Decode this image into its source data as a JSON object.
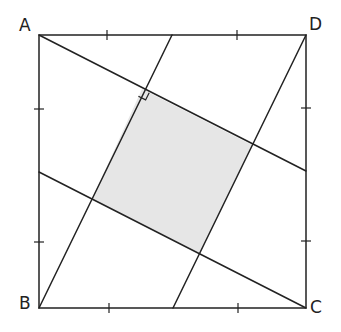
{
  "diagram": {
    "type": "geometry",
    "vertices": {
      "A": {
        "label": "A",
        "x": 39,
        "y": 35
      },
      "B": {
        "label": "B",
        "x": 39,
        "y": 308
      },
      "C": {
        "label": "C",
        "x": 306,
        "y": 308
      },
      "D": {
        "label": "D",
        "x": 306,
        "y": 35
      }
    },
    "midpoints": {
      "AD_mid": {
        "x": 172,
        "y": 35
      },
      "BC_mid": {
        "x": 173,
        "y": 308
      },
      "AB_mid": {
        "x": 39,
        "y": 172
      },
      "DC_mid": {
        "x": 306,
        "y": 171
      }
    },
    "segments": [
      {
        "name": "A-to-DC-mid",
        "from": "A",
        "to": "DC_mid"
      },
      {
        "name": "B-to-AD-mid",
        "from": "B",
        "to": "AD_mid"
      },
      {
        "name": "C-to-AB-mid",
        "from": "C",
        "to": "AB_mid"
      },
      {
        "name": "D-to-BC-mid",
        "from": "D",
        "to": "BC_mid"
      }
    ],
    "inner_square": {
      "points": [
        [
          142,
          89
        ],
        [
          252,
          145
        ],
        [
          200,
          253
        ],
        [
          92,
          199
        ]
      ],
      "fill": "#e6e6e6"
    },
    "right_angle_mark": {
      "corner": [
        142,
        89
      ],
      "size": 8
    },
    "tick_marks": {
      "top": [
        107,
        237
      ],
      "bottom": [
        109,
        238
      ],
      "left": [
        109,
        242
      ],
      "right": [
        108,
        241
      ]
    },
    "colors": {
      "stroke": "#222222",
      "fill": "#e6e6e6",
      "background": "#ffffff"
    }
  }
}
